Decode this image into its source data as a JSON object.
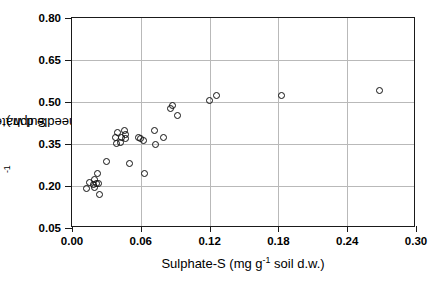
{
  "chart_data": {
    "type": "scatter",
    "title": "",
    "xlabel": "Sulphate-S (mg g-1 soil d.w.)",
    "ylabel": "Sulphate-S (mg g-1 needle d.w.)",
    "xlabel_parts": {
      "pre": "Sulphate-S (mg g",
      "sup": "-1",
      "post": " soil d.w.)"
    },
    "ylabel_parts": {
      "pre": "Sulphate-S (mg g",
      "sup": "-1",
      "post": " needle d.w.)"
    },
    "xlim": [
      0.0,
      0.3
    ],
    "ylim": [
      0.05,
      0.8
    ],
    "xticks": [
      0.0,
      0.06,
      0.12,
      0.18,
      0.24,
      0.3
    ],
    "yticks": [
      0.05,
      0.2,
      0.35,
      0.5,
      0.65,
      0.8
    ],
    "xticklabels": [
      "0.00",
      "0.06",
      "0.12",
      "0.18",
      "0.24",
      "0.30"
    ],
    "yticklabels": [
      "0.05",
      "0.20",
      "0.35",
      "0.50",
      "0.65",
      "0.80"
    ],
    "grid": true,
    "grid_color": "#b9b9b9",
    "marker": "open-circle",
    "marker_color": "#111111",
    "legend": null,
    "n_points": 32,
    "points": [
      {
        "x": 0.013,
        "y": 0.19
      },
      {
        "x": 0.015,
        "y": 0.213
      },
      {
        "x": 0.019,
        "y": 0.207
      },
      {
        "x": 0.02,
        "y": 0.223
      },
      {
        "x": 0.02,
        "y": 0.196
      },
      {
        "x": 0.021,
        "y": 0.21
      },
      {
        "x": 0.022,
        "y": 0.246
      },
      {
        "x": 0.023,
        "y": 0.209
      },
      {
        "x": 0.024,
        "y": 0.171
      },
      {
        "x": 0.03,
        "y": 0.288
      },
      {
        "x": 0.038,
        "y": 0.372
      },
      {
        "x": 0.039,
        "y": 0.352
      },
      {
        "x": 0.04,
        "y": 0.39
      },
      {
        "x": 0.042,
        "y": 0.355
      },
      {
        "x": 0.043,
        "y": 0.373
      },
      {
        "x": 0.046,
        "y": 0.397
      },
      {
        "x": 0.047,
        "y": 0.37
      },
      {
        "x": 0.047,
        "y": 0.385
      },
      {
        "x": 0.05,
        "y": 0.282
      },
      {
        "x": 0.058,
        "y": 0.372
      },
      {
        "x": 0.06,
        "y": 0.37
      },
      {
        "x": 0.062,
        "y": 0.362
      },
      {
        "x": 0.063,
        "y": 0.245
      },
      {
        "x": 0.072,
        "y": 0.398
      },
      {
        "x": 0.073,
        "y": 0.348
      },
      {
        "x": 0.08,
        "y": 0.372
      },
      {
        "x": 0.086,
        "y": 0.478
      },
      {
        "x": 0.088,
        "y": 0.487
      },
      {
        "x": 0.092,
        "y": 0.452
      },
      {
        "x": 0.12,
        "y": 0.505
      },
      {
        "x": 0.126,
        "y": 0.524
      },
      {
        "x": 0.183,
        "y": 0.523
      },
      {
        "x": 0.268,
        "y": 0.54
      }
    ]
  }
}
